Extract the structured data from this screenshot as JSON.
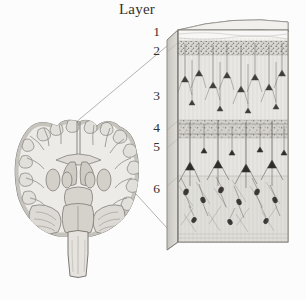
{
  "figure": {
    "background_color": "#fcfcfc",
    "ink_color": "#4a4643",
    "tissue_fill": "#eceae6",
    "gray_matter_fill": "#d9d6d0",
    "column_face_fill": "#f2f1ee",
    "column_side_fill": "#dcdad5",
    "column_top_fill": "#eeedea",
    "leader_line_color": "#9b9894"
  },
  "labels": {
    "layer_heading": "Layer",
    "layer_numbers": [
      "1",
      "2",
      "3",
      "4",
      "5",
      "6"
    ]
  },
  "brain": {
    "name": "coronal-brain-section",
    "structures": [
      "cerebral cortex",
      "gyri",
      "sulci",
      "white matter",
      "lateral ventricles",
      "basal ganglia",
      "thalamus",
      "cerebellum",
      "brainstem"
    ]
  },
  "column": {
    "name": "cortical-column",
    "layer_bands": [
      {
        "number": "1",
        "name": "molecular layer",
        "top": 30,
        "bottom": 41,
        "shade": "#f6f5f3"
      },
      {
        "number": "2",
        "name": "external granular",
        "top": 41,
        "bottom": 55,
        "shade": "#e3e1dd"
      },
      {
        "number": "3",
        "name": "external pyramidal",
        "top": 55,
        "bottom": 120,
        "shade": "#efeeeb"
      },
      {
        "number": "4",
        "name": "internal granular",
        "top": 120,
        "bottom": 138,
        "shade": "#dedbd6"
      },
      {
        "number": "5",
        "name": "internal pyramidal",
        "top": 138,
        "bottom": 176,
        "shade": "#ecebe8"
      },
      {
        "number": "6",
        "name": "multiform layer",
        "top": 176,
        "bottom": 242,
        "shade": "#e6e4e0"
      }
    ],
    "left": 167,
    "right": 288,
    "top": 18,
    "bottom": 242
  },
  "leader_lines": [
    {
      "name": "upper-leader",
      "x1": 75,
      "y1": 123,
      "x2": 167,
      "y2": 48
    },
    {
      "name": "lower-leader",
      "x1": 116,
      "y1": 172,
      "x2": 167,
      "y2": 226
    }
  ]
}
